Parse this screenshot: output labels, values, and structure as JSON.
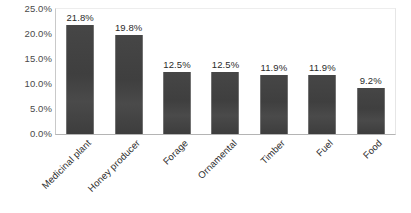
{
  "chart_data": {
    "type": "bar",
    "title": "",
    "subtitle": "",
    "xlabel": "",
    "ylabel": "",
    "categories": [
      "Medicinal plant",
      "Honey producer",
      "Forage",
      "Ornamental",
      "Timber",
      "Fuel",
      "Food"
    ],
    "values": [
      21.8,
      19.8,
      12.5,
      12.5,
      11.9,
      11.9,
      9.2
    ],
    "data_labels": [
      "21.8%",
      "19.8%",
      "12.5%",
      "12.5%",
      "11.9%",
      "11.9%",
      "9.2%"
    ],
    "ylim": [
      0,
      25
    ],
    "ytick_values": [
      0,
      5,
      10,
      15,
      20,
      25
    ],
    "ytick_labels": [
      "0.0%",
      "5.0%",
      "10.0%",
      "15.0%",
      "20.0%",
      "25.0%"
    ],
    "grid": false,
    "legend": false,
    "legend_position": "none",
    "series": [
      {
        "name": "",
        "values": [
          21.8,
          19.8,
          12.5,
          12.5,
          11.9,
          11.9,
          9.2
        ],
        "color": "#424242"
      }
    ],
    "bar_color": "#424242",
    "axis_color": "#b4b4b4",
    "label_color": "#2f2f2f",
    "tick_label_color": "#4a4a4a",
    "background_color": "#ffffff",
    "xtick_label_rotation": -45
  }
}
